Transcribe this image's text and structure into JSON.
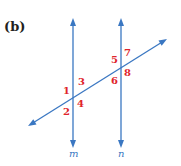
{
  "figure": {
    "part_label": "(b)",
    "colors": {
      "lines": "#3a77c2",
      "angle_labels": "#e0242b",
      "part_label": "#231f20"
    },
    "lines": [
      {
        "id": "m",
        "name": "m",
        "kind": "parallel"
      },
      {
        "id": "n",
        "name": "n",
        "kind": "parallel"
      },
      {
        "id": "t",
        "name": "",
        "kind": "transversal"
      }
    ],
    "intersections": [
      {
        "line": "m",
        "angles": [
          {
            "label": "1",
            "position": "upper-left"
          },
          {
            "label": "3",
            "position": "upper-right"
          },
          {
            "label": "2",
            "position": "lower-left"
          },
          {
            "label": "4",
            "position": "lower-right"
          }
        ]
      },
      {
        "line": "n",
        "angles": [
          {
            "label": "5",
            "position": "upper-left"
          },
          {
            "label": "7",
            "position": "upper-right"
          },
          {
            "label": "6",
            "position": "lower-left"
          },
          {
            "label": "8",
            "position": "lower-right"
          }
        ]
      }
    ]
  }
}
